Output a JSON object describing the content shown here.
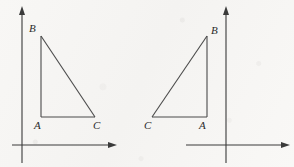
{
  "figure": {
    "title": "",
    "background_color": "#f8f7f5",
    "ink_color": "#3a3a3a",
    "label_color": "#2b2b2b",
    "panels": [
      {
        "name": "left-panel",
        "axes": {
          "y_axis": {
            "x": 22,
            "y_top": 8,
            "y_bottom": 163,
            "arrow": "up"
          },
          "x_axis": {
            "y": 145,
            "x_left": 12,
            "x_right": 115,
            "arrow": "right"
          }
        },
        "triangle": {
          "vertices": [
            {
              "label": "B",
              "x": 41,
              "y": 36
            },
            {
              "label": "A",
              "x": 41,
              "y": 117
            },
            {
              "label": "C",
              "x": 95,
              "y": 117
            }
          ],
          "right_angle_at": "A",
          "orientation": "right-angle lower-left, vertical leg AB on left, hypotenuse B to C"
        },
        "labels": [
          {
            "text": "B",
            "x": 29,
            "y": 23
          },
          {
            "text": "A",
            "x": 34,
            "y": 120
          },
          {
            "text": "C",
            "x": 93,
            "y": 120
          }
        ]
      },
      {
        "name": "right-panel",
        "axes": {
          "y_axis": {
            "x": 226,
            "y_top": 8,
            "y_bottom": 163,
            "arrow": "up"
          },
          "x_axis": {
            "y": 145,
            "x_left": 186,
            "x_right": 288,
            "arrow": "right"
          }
        },
        "triangle": {
          "vertices": [
            {
              "label": "B",
              "x": 207,
              "y": 36
            },
            {
              "label": "A",
              "x": 207,
              "y": 117
            },
            {
              "label": "C",
              "x": 152,
              "y": 117
            }
          ],
          "right_angle_at": "A",
          "orientation": "mirror image of left triangle, vertical leg AB on right, hypotenuse C to B"
        },
        "labels": [
          {
            "text": "B",
            "x": 211,
            "y": 25
          },
          {
            "text": "A",
            "x": 199,
            "y": 120
          },
          {
            "text": "C",
            "x": 144,
            "y": 120
          }
        ]
      }
    ]
  }
}
